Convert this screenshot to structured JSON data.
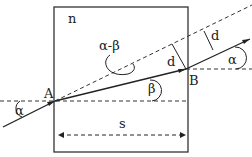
{
  "diagram": {
    "medium_label": "n",
    "point_a": "A",
    "point_b": "B",
    "angle_incident": "α",
    "angle_refracted": "β",
    "angle_deviation": "α-β",
    "displacement_1": "d",
    "displacement_2": "d",
    "angle_exit": "α",
    "width_label": "s"
  }
}
